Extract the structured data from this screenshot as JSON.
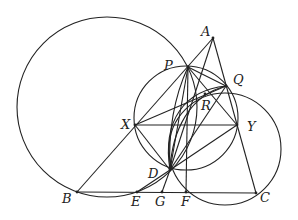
{
  "diagram": {
    "type": "geometry-figure",
    "points": {
      "A": {
        "label": "A",
        "x": 213,
        "y": 38,
        "lx": 201,
        "ly": 36
      },
      "P": {
        "label": "P",
        "x": 188,
        "y": 67,
        "lx": 164,
        "ly": 70
      },
      "Q": {
        "label": "Q",
        "x": 226,
        "y": 86,
        "lx": 233,
        "ly": 84
      },
      "R": {
        "label": "R",
        "x": 205,
        "y": 94,
        "lx": 201,
        "ly": 110
      },
      "X": {
        "label": "X",
        "x": 135,
        "y": 125,
        "lx": 121,
        "ly": 129
      },
      "Y": {
        "label": "Y",
        "x": 237,
        "y": 125,
        "lx": 247,
        "ly": 131
      },
      "D": {
        "label": "D",
        "x": 170,
        "y": 170,
        "lx": 148,
        "ly": 178
      },
      "B": {
        "label": "B",
        "x": 77,
        "y": 192,
        "lx": 62,
        "ly": 203
      },
      "E": {
        "label": "E",
        "x": 137,
        "y": 192,
        "lx": 131,
        "ly": 206
      },
      "G": {
        "label": "G",
        "x": 162,
        "y": 192,
        "lx": 155,
        "ly": 206
      },
      "F": {
        "label": "F",
        "x": 186,
        "y": 192,
        "lx": 181,
        "ly": 206
      },
      "C": {
        "label": "C",
        "x": 256,
        "y": 193,
        "lx": 260,
        "ly": 202
      }
    },
    "circles": [
      {
        "name": "big-circle",
        "cx": 107,
        "cy": 107,
        "r": 90
      },
      {
        "name": "middle-circle-PXYD",
        "cx": 186,
        "cy": 118,
        "r": 52
      },
      {
        "name": "right-circle-QYFC",
        "cx": 225,
        "cy": 149,
        "r": 56
      }
    ],
    "segments": [
      [
        "A",
        "B"
      ],
      [
        "A",
        "C"
      ],
      [
        "B",
        "C"
      ],
      [
        "X",
        "Y"
      ],
      [
        "A",
        "D"
      ],
      [
        "P",
        "D"
      ],
      [
        "Q",
        "D"
      ],
      [
        "Y",
        "D"
      ],
      [
        "X",
        "D"
      ],
      [
        "D",
        "E"
      ],
      [
        "D",
        "G"
      ],
      [
        "P",
        "Y"
      ],
      [
        "P",
        "Q"
      ],
      [
        "Q",
        "X"
      ],
      [
        "P",
        "F"
      ]
    ]
  }
}
